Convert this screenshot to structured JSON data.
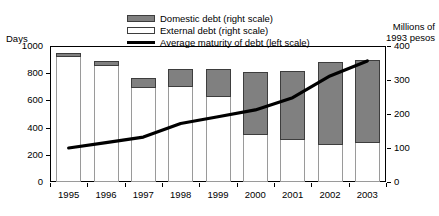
{
  "chart_data": {
    "type": "bar",
    "title": "",
    "subtitle": "",
    "xlabel": "",
    "ylabel": "Days",
    "ylabel_right": "Millions of\n1993 pesos",
    "grid": false,
    "legend_position": "top-center",
    "categories": [
      "1995",
      "1996",
      "1997",
      "1998",
      "1999",
      "2000",
      "2001",
      "2002",
      "2003"
    ],
    "left_axis": {
      "label": "Days",
      "ticks": [
        0,
        200,
        400,
        600,
        800,
        1000
      ],
      "ylim": [
        0,
        1000
      ]
    },
    "right_axis": {
      "label_line1": "Millions of",
      "label_line2": "1993 pesos",
      "ticks": [
        0,
        100,
        200,
        300,
        400
      ],
      "ylim": [
        0,
        400
      ]
    },
    "series": [
      {
        "name": "External debt (right scale)",
        "type": "bar",
        "stack": "debt",
        "axis": "right",
        "color": "#ffffff",
        "edge_color": "#9a9a9a",
        "values": [
          368,
          341,
          277,
          280,
          250,
          138,
          123,
          109,
          115
        ]
      },
      {
        "name": "Domestic debt (right scale)",
        "type": "bar",
        "stack": "debt",
        "axis": "right",
        "color": "#808080",
        "edge_color": "#3d3d3d",
        "values": [
          12,
          15,
          29,
          52,
          82,
          185,
          203,
          244,
          244
        ]
      },
      {
        "name": "Average maturity of debt (left scale)",
        "type": "line",
        "axis": "left",
        "color": "#000000",
        "values": [
          250,
          290,
          330,
          430,
          480,
          530,
          620,
          780,
          890
        ]
      }
    ],
    "stack_totals": [
      380,
      356,
      306,
      332,
      332,
      323,
      326,
      353,
      359
    ]
  },
  "legend": {
    "items": [
      {
        "label": "Domestic debt (right scale)",
        "swatch": "filled-gray-swatch"
      },
      {
        "label": "External debt (right scale)",
        "swatch": "hollow-white-swatch"
      },
      {
        "label": "Average maturity of debt (left scale)",
        "swatch": "black-line-swatch"
      }
    ]
  },
  "axis_captions": {
    "left": "Days",
    "right_line1": "Millions of",
    "right_line2": "1993 pesos"
  }
}
